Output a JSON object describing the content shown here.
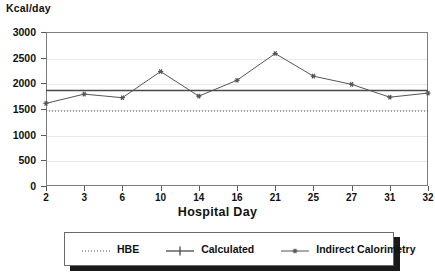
{
  "chart_data": {
    "type": "line",
    "title": "",
    "ylabel": "Kcal/day",
    "xlabel": "Hospital Day",
    "categories": [
      "2",
      "3",
      "6",
      "10",
      "14",
      "16",
      "21",
      "25",
      "27",
      "31",
      "32"
    ],
    "x": [
      2,
      3,
      6,
      10,
      14,
      16,
      21,
      25,
      27,
      31,
      32
    ],
    "ylim": [
      0,
      3000
    ],
    "ytick_labels": [
      "0",
      "500",
      "1000",
      "1500",
      "2000",
      "2500",
      "3000"
    ],
    "ytick_values": [
      0,
      500,
      1000,
      1500,
      2000,
      2500,
      3000
    ],
    "grid": true,
    "legend_position": "bottom",
    "series": [
      {
        "name": "HBE",
        "style": "dotted",
        "marker": "none",
        "color": "#555555",
        "constant": 1460,
        "values": [
          1460,
          1460,
          1460,
          1460,
          1460,
          1460,
          1460,
          1460,
          1460,
          1460,
          1460
        ]
      },
      {
        "name": "Calculated",
        "style": "solid",
        "marker": "plus",
        "color": "#4a4a4a",
        "constant": 1860,
        "values": [
          1860,
          1860,
          1860,
          1860,
          1860,
          1860,
          1860,
          1860,
          1860,
          1860,
          1860
        ]
      },
      {
        "name": "Indirect Calorimetry",
        "style": "solid",
        "marker": "star",
        "color": "#555555",
        "values": [
          1610,
          1790,
          1720,
          2230,
          1750,
          2060,
          2580,
          2140,
          1980,
          1730,
          1810
        ]
      }
    ]
  },
  "legend": {
    "items": [
      {
        "label": "HBE",
        "marker": "dotted-line-swatch"
      },
      {
        "label": "Calculated",
        "marker": "solid-plus-swatch"
      },
      {
        "label": "Indirect Calorimetry",
        "marker": "solid-star-swatch"
      }
    ]
  }
}
